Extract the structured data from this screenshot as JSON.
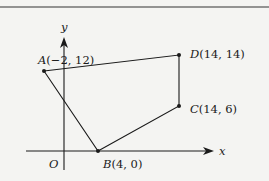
{
  "diagram": {
    "axes": {
      "x_label": "x",
      "y_label": "y",
      "origin_label": "O"
    },
    "points": [
      {
        "name": "A",
        "label": "(−2, 12)",
        "coords": [
          -2,
          12
        ]
      },
      {
        "name": "B",
        "label": "(4, 0)",
        "coords": [
          4,
          0
        ]
      },
      {
        "name": "C",
        "label": "(14, 6)",
        "coords": [
          14,
          6
        ]
      },
      {
        "name": "D",
        "label": "(14, 14)",
        "coords": [
          14,
          14
        ]
      }
    ],
    "polygon": [
      "A",
      "B",
      "C",
      "D"
    ],
    "colors": {
      "stroke": "#1a1a1a",
      "background": "#f4f4f2"
    }
  }
}
